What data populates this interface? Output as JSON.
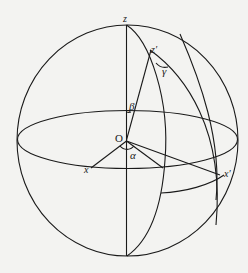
{
  "figure": {
    "type": "spherical-geometry-diagram",
    "labels": {
      "z": "z",
      "z_prime": "z′",
      "gamma": "γ",
      "beta": "β",
      "origin": "O",
      "alpha": "α",
      "x": "x",
      "x_prime": "x′"
    },
    "colors": {
      "line": "#1a1a1a",
      "background": "#f3f3f1"
    }
  }
}
